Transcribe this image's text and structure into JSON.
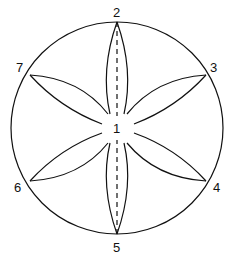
{
  "diagram": {
    "labels": {
      "center": "1",
      "top": "2",
      "upper_right": "3",
      "lower_right": "4",
      "bottom": "5",
      "lower_left": "6",
      "upper_left": "7"
    },
    "colors": {
      "stroke": "#111111",
      "background": "#ffffff"
    }
  }
}
